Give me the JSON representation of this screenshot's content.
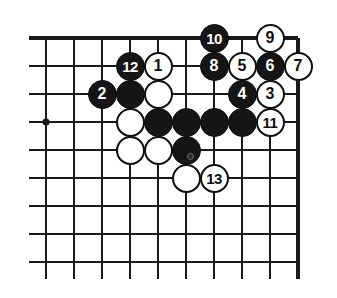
{
  "figure": {
    "type": "go-board-diagram",
    "title": "",
    "board": {
      "columns": 10,
      "rows": 9,
      "origin_x": 46,
      "origin_y": 38,
      "spacing": 28,
      "line_color": "#1a1a1a",
      "edge_color": "#111111",
      "background_color": "#ffffff",
      "top_edge_row": 1,
      "right_edge_column": 10,
      "star_points": [
        {
          "col": 1,
          "row": 4
        }
      ]
    },
    "stone_colors": {
      "black_fill": "#151515",
      "black_label": "#ffffff",
      "white_fill": "#ffffff",
      "white_label": "#101010",
      "white_border": "#101010"
    },
    "stones": [
      {
        "label": "10",
        "color": "black",
        "col": 7,
        "row": 1
      },
      {
        "label": "9",
        "color": "white",
        "col": 9,
        "row": 1
      },
      {
        "label": "12",
        "color": "black",
        "col": 4,
        "row": 2
      },
      {
        "label": "1",
        "color": "white",
        "col": 5,
        "row": 2
      },
      {
        "label": "8",
        "color": "black",
        "col": 7,
        "row": 2
      },
      {
        "label": "5",
        "color": "white",
        "col": 8,
        "row": 2
      },
      {
        "label": "6",
        "color": "black",
        "col": 9,
        "row": 2
      },
      {
        "label": "7",
        "color": "white",
        "col": 10,
        "row": 2
      },
      {
        "label": "2",
        "color": "black",
        "col": 3,
        "row": 3
      },
      {
        "label": "",
        "color": "black",
        "col": 4,
        "row": 3
      },
      {
        "label": "",
        "color": "white",
        "col": 5,
        "row": 3
      },
      {
        "label": "4",
        "color": "black",
        "col": 8,
        "row": 3
      },
      {
        "label": "3",
        "color": "white",
        "col": 9,
        "row": 3
      },
      {
        "label": "",
        "color": "white",
        "col": 4,
        "row": 4
      },
      {
        "label": "",
        "color": "black",
        "col": 5,
        "row": 4
      },
      {
        "label": "",
        "color": "black",
        "col": 6,
        "row": 4
      },
      {
        "label": "",
        "color": "black",
        "col": 7,
        "row": 4
      },
      {
        "label": "",
        "color": "black",
        "col": 8,
        "row": 4
      },
      {
        "label": "11",
        "color": "white",
        "col": 9,
        "row": 4
      },
      {
        "label": "",
        "color": "white",
        "col": 4,
        "row": 5
      },
      {
        "label": "",
        "color": "white",
        "col": 5,
        "row": 5
      },
      {
        "label": "",
        "color": "black",
        "col": 6,
        "row": 5,
        "mark": "dot"
      },
      {
        "label": "",
        "color": "white",
        "col": 6,
        "row": 6
      },
      {
        "label": "13",
        "color": "white",
        "col": 7,
        "row": 6
      }
    ]
  }
}
